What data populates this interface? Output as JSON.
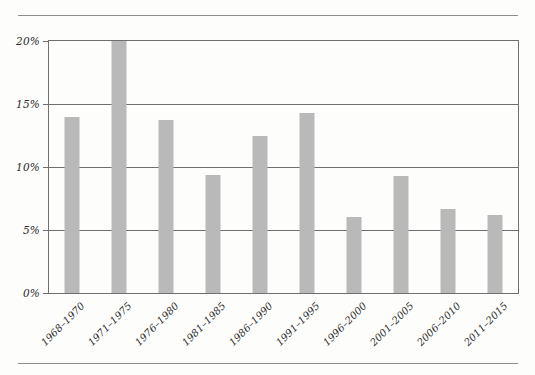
{
  "chart_data": {
    "type": "bar",
    "title": "",
    "subtitle": "",
    "xlabel": "",
    "ylabel": "",
    "categories": [
      "1968–1970",
      "1971–1975",
      "1976–1980",
      "1981–1985",
      "1986–1990",
      "1991–1995",
      "1996–2000",
      "2001–2005",
      "2006–2010",
      "2011–2015"
    ],
    "values": [
      14.0,
      20.0,
      13.7,
      9.4,
      12.5,
      14.3,
      6.0,
      9.3,
      6.7,
      6.2
    ],
    "value_unit": "%",
    "ylim": [
      0,
      20
    ],
    "ytick_values": [
      0,
      5,
      10,
      15,
      20
    ],
    "ytick_labels": [
      "0%",
      "5%",
      "10%",
      "15%",
      "20%"
    ],
    "grid": "horizontal",
    "legend": "none",
    "bar_color": "#b9b9b9",
    "axis_color": "#6f6f6f",
    "annotations": []
  },
  "figure": {
    "background_color": "#fdfdfc",
    "rule_color": "#8e8e8e"
  }
}
